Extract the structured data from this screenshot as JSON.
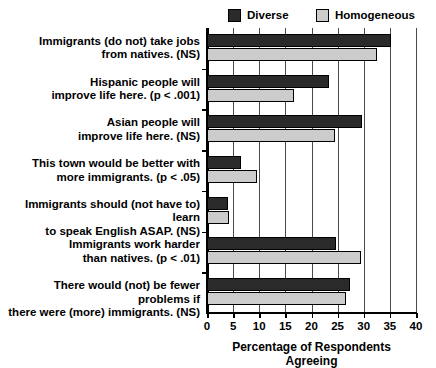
{
  "chart_data": {
    "type": "bar",
    "orientation": "horizontal",
    "title": "",
    "xlabel": "Percentage of Respondents Agreeing",
    "ylabel": "",
    "xlim": [
      0,
      40
    ],
    "xticks": [
      0,
      5,
      10,
      15,
      20,
      25,
      30,
      35,
      40
    ],
    "xtick_labels": [
      "0",
      "5",
      "10",
      "15",
      "20",
      "25",
      "30",
      "35",
      "40"
    ],
    "grid": true,
    "grid_axis": "x",
    "legend_position": "top",
    "categories": [
      "Immigrants (do not) take jobs from natives. (NS)",
      "Hispanic people will improve life here. (p < .001)",
      "Asian people will improve life here. (NS)",
      "This town would be better with more immigrants. (p < .05)",
      "Immigrants should (not have to) learn to speak English ASAP. (NS)",
      "Immigrants work harder than natives. (p < .01)",
      "There would (not) be fewer problems if there were (more) immigrants. (NS)"
    ],
    "category_lines": [
      [
        "Immigrants (do not) take jobs",
        "from natives. (NS)"
      ],
      [
        "Hispanic people will",
        "improve life here. (p < .001)"
      ],
      [
        "Asian people will",
        "improve life here. (NS)"
      ],
      [
        "This town would be better with",
        "more immigrants. (p < .05)"
      ],
      [
        "Immigrants should (not have to) learn",
        "to speak English ASAP. (NS)"
      ],
      [
        "Immigrants work harder",
        "than natives. (p < .01)"
      ],
      [
        "There would (not) be fewer problems if",
        "there were (more) immigrants. (NS)"
      ]
    ],
    "series": [
      {
        "name": "Diverse",
        "color": "#2a2a2a",
        "values": [
          35.3,
          23.4,
          29.7,
          6.5,
          4.1,
          24.7,
          27.4
        ]
      },
      {
        "name": "Homogeneous",
        "color": "#cccccc",
        "values": [
          32.6,
          16.7,
          24.5,
          9.6,
          4.2,
          29.5,
          26.6
        ]
      }
    ]
  },
  "legend": {
    "entries": [
      {
        "label": "Diverse",
        "color": "#2a2a2a"
      },
      {
        "label": "Homogeneous",
        "color": "#cccccc"
      }
    ]
  },
  "axis": {
    "x_title": "Percentage of Respondents Agreeing"
  }
}
